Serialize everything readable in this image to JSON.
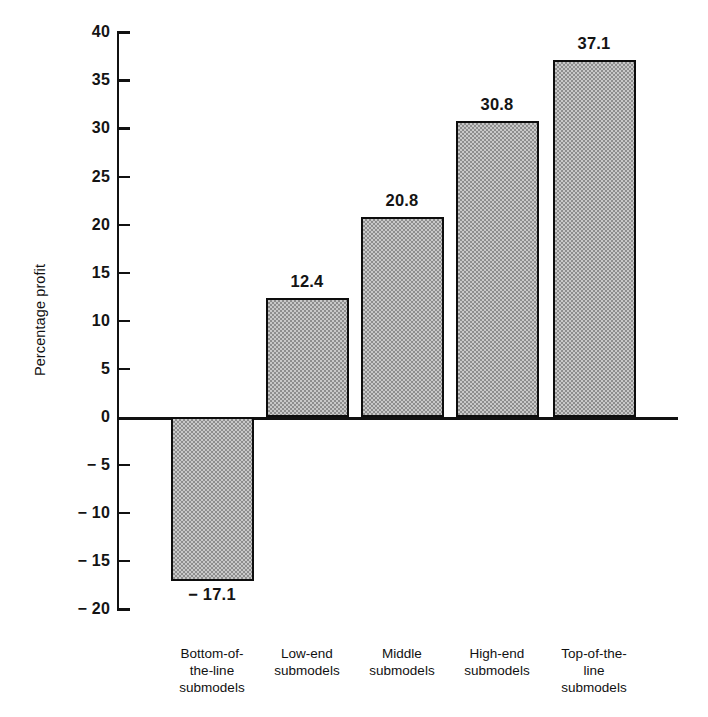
{
  "chart_data": {
    "type": "bar",
    "title": "",
    "xlabel": "",
    "ylabel": "Percentage profit",
    "ylim": [
      -20,
      40
    ],
    "ytick_step": 5,
    "grid": false,
    "legend": null,
    "categories": [
      "Bottom-of-the-line submodels",
      "Low-end submodels",
      "Middle submodels",
      "High-end submodels",
      "Top-of-the-line submodels"
    ],
    "category_lines": [
      [
        "Bottom-of-",
        "the-line",
        "submodels"
      ],
      [
        "Low-end",
        "submodels"
      ],
      [
        "Middle",
        "submodels"
      ],
      [
        "High-end",
        "submodels"
      ],
      [
        "Top-of-the-",
        "line",
        "submodels"
      ]
    ],
    "values": [
      -17.1,
      12.4,
      20.8,
      30.8,
      37.1
    ],
    "value_labels": [
      "− 17.1",
      "12.4",
      "20.8",
      "30.8",
      "37.1"
    ],
    "ytick_values": [
      40,
      35,
      30,
      25,
      20,
      15,
      10,
      5,
      0,
      -5,
      -10,
      -15,
      -20
    ],
    "ytick_labels": [
      "40",
      "35",
      "30",
      "25",
      "20",
      "15",
      "10",
      "5",
      "0",
      "− 5",
      "− 10",
      "− 15",
      "− 20"
    ],
    "bar_fill_color": "#c9c9c9",
    "bar_pattern_color": "#8e8e8e",
    "bar_edge_color": "#0d0d0d",
    "axis_color": "#111111",
    "background_color": "#ffffff"
  },
  "geometry": {
    "axis_x": 117,
    "y_top_px": 33,
    "y_zero_px": 417,
    "y_bottom_px": 610,
    "px_per_unit": 9.617,
    "bar_width": 83,
    "bar_centers": [
      212,
      307,
      402,
      497,
      594
    ]
  }
}
